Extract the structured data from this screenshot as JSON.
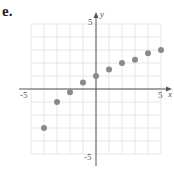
{
  "label": "e.",
  "chart_data": {
    "type": "scatter",
    "title": "",
    "xlabel": "x",
    "ylabel": "y",
    "xlim": [
      -5,
      5
    ],
    "ylim": [
      -5,
      5
    ],
    "grid": true,
    "x": [
      -4,
      -3,
      -2,
      -1,
      0,
      1,
      2,
      3,
      4,
      5
    ],
    "y": [
      -3,
      -1,
      -0.25,
      0.5,
      1,
      1.5,
      2,
      2.25,
      2.75,
      3
    ],
    "tick_labels": {
      "x": [
        "-5",
        "5"
      ],
      "y": [
        "5",
        "-5"
      ]
    },
    "point_color": "#8a8a8a"
  }
}
